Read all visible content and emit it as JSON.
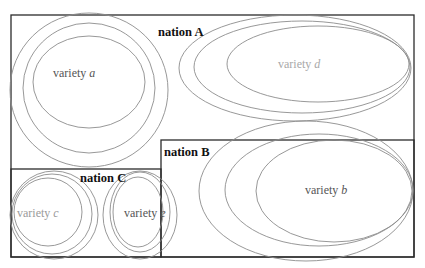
{
  "diagram": {
    "type": "nested-ellipse-venn",
    "nations": [
      {
        "id": "A",
        "label": "nation A"
      },
      {
        "id": "B",
        "label": "nation B"
      },
      {
        "id": "C",
        "label": "nation C"
      }
    ],
    "varieties": [
      {
        "id": "a",
        "prefix": "variety ",
        "letter": "a",
        "nation": "A",
        "color": "#555555"
      },
      {
        "id": "b",
        "prefix": "variety ",
        "letter": "b",
        "nation": "B",
        "color": "#555555"
      },
      {
        "id": "c",
        "prefix": "variety ",
        "letter": "c",
        "nation": "C",
        "color": "#9a9a9a"
      },
      {
        "id": "d",
        "prefix": "variety ",
        "letter": "d",
        "nation": "A",
        "color": "#a8a8a8"
      },
      {
        "id": "e",
        "prefix": "variety ",
        "letter": "e",
        "nation": "C/B",
        "color": "#555555"
      }
    ],
    "colors": {
      "box_stroke": "#2b2b2b",
      "ellipse_stroke": "#8c8c8c",
      "nation_text": "#111111"
    }
  }
}
